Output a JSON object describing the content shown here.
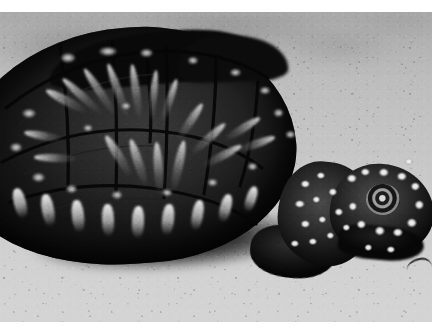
{
  "media": {
    "type": "photograph",
    "color_mode": "black-and-white",
    "orientation": "landscape",
    "width_px": 448,
    "height_px": 336,
    "has_visible_text": false,
    "print_border": {
      "color": "#ffffff",
      "top_px": 12,
      "right_px": 16,
      "bottom_px": 14,
      "left_px": 0
    }
  },
  "scene": {
    "subject": "box turtle",
    "subject_view": "three-quarter right, head extended toward lower right",
    "setting": "dry sandy ground",
    "lighting": "bright overhead sunlight, hard cast shadow beneath animal",
    "focus": "subject sharp, background blurred"
  },
  "subject": {
    "carapace_label": "carapace",
    "head_label": "head",
    "neck_label": "neck",
    "eye_label": "eye",
    "foreleg_label": "foreleg",
    "marginal_scutes_label": "marginal scutes",
    "pattern": "dark shell with radiating pale streaks in each scute; dark skin with scattered pale spots"
  },
  "background": {
    "ground_label": "sand",
    "shadow_label": "cast shadow",
    "rocks_label": "pale rocks",
    "debris_label": "twig"
  },
  "palette": {
    "border_white": "#ffffff",
    "sand_light": "#d4d4d4",
    "sand_mid": "#c2c2c2",
    "sand_dark": "#a9a9a9",
    "shell_dark": "#141414",
    "shell_black": "#0b0b0b",
    "skin_mid": "#303030",
    "highlight_white": "#f4f4f4",
    "shadow_black": "#080808"
  },
  "regions": {
    "rays": [
      {
        "left": 62,
        "top": 66,
        "w": 9,
        "h": 46,
        "rot": -62
      },
      {
        "left": 78,
        "top": 58,
        "w": 8,
        "h": 52,
        "rot": -48
      },
      {
        "left": 96,
        "top": 52,
        "w": 8,
        "h": 56,
        "rot": -34
      },
      {
        "left": 114,
        "top": 50,
        "w": 8,
        "h": 58,
        "rot": -20
      },
      {
        "left": 132,
        "top": 52,
        "w": 8,
        "h": 56,
        "rot": -8
      },
      {
        "left": 150,
        "top": 58,
        "w": 7,
        "h": 52,
        "rot": 6
      },
      {
        "left": 166,
        "top": 66,
        "w": 7,
        "h": 46,
        "rot": 18
      },
      {
        "left": 40,
        "top": 104,
        "w": 8,
        "h": 40,
        "rot": -80
      },
      {
        "left": 52,
        "top": 124,
        "w": 8,
        "h": 44,
        "rot": -88
      },
      {
        "left": 186,
        "top": 88,
        "w": 8,
        "h": 44,
        "rot": 34
      },
      {
        "left": 204,
        "top": 104,
        "w": 8,
        "h": 46,
        "rot": 48
      },
      {
        "left": 218,
        "top": 122,
        "w": 8,
        "h": 44,
        "rot": 62
      },
      {
        "left": 174,
        "top": 128,
        "w": 9,
        "h": 52,
        "rot": 12
      },
      {
        "left": 154,
        "top": 130,
        "w": 9,
        "h": 54,
        "rot": -4
      },
      {
        "left": 134,
        "top": 126,
        "w": 9,
        "h": 50,
        "rot": -18
      },
      {
        "left": 114,
        "top": 120,
        "w": 9,
        "h": 48,
        "rot": -32
      },
      {
        "left": 238,
        "top": 96,
        "w": 8,
        "h": 42,
        "rot": 58
      },
      {
        "left": 252,
        "top": 112,
        "w": 8,
        "h": 40,
        "rot": 70
      }
    ],
    "blotches": [
      {
        "left": 58,
        "top": 40,
        "w": 20,
        "h": 13
      },
      {
        "left": 96,
        "top": 34,
        "w": 24,
        "h": 12
      },
      {
        "left": 138,
        "top": 36,
        "w": 17,
        "h": 11
      },
      {
        "left": 186,
        "top": 44,
        "w": 14,
        "h": 10
      },
      {
        "left": 228,
        "top": 56,
        "w": 15,
        "h": 10
      },
      {
        "left": 258,
        "top": 74,
        "w": 14,
        "h": 10
      },
      {
        "left": 272,
        "top": 96,
        "w": 13,
        "h": 11
      },
      {
        "left": 284,
        "top": 118,
        "w": 13,
        "h": 10
      },
      {
        "left": 20,
        "top": 96,
        "w": 18,
        "h": 12
      },
      {
        "left": 8,
        "top": 130,
        "w": 16,
        "h": 12
      },
      {
        "left": 30,
        "top": 160,
        "w": 17,
        "h": 12
      },
      {
        "left": 64,
        "top": 172,
        "w": 15,
        "h": 11
      },
      {
        "left": 110,
        "top": 178,
        "w": 14,
        "h": 11
      },
      {
        "left": 160,
        "top": 176,
        "w": 14,
        "h": 10
      },
      {
        "left": 206,
        "top": 166,
        "w": 13,
        "h": 10
      },
      {
        "left": 246,
        "top": 150,
        "w": 13,
        "h": 10
      },
      {
        "left": 120,
        "top": 90,
        "w": 12,
        "h": 9
      },
      {
        "left": 82,
        "top": 112,
        "w": 12,
        "h": 9
      }
    ],
    "marginals": [
      {
        "left": 14,
        "top": 176,
        "w": 12,
        "h": 30,
        "rot": -14
      },
      {
        "left": 42,
        "top": 182,
        "w": 12,
        "h": 32,
        "rot": -10
      },
      {
        "left": 72,
        "top": 188,
        "w": 12,
        "h": 32,
        "rot": -6
      },
      {
        "left": 102,
        "top": 192,
        "w": 12,
        "h": 32,
        "rot": -2
      },
      {
        "left": 132,
        "top": 194,
        "w": 12,
        "h": 32,
        "rot": 2
      },
      {
        "left": 162,
        "top": 192,
        "w": 12,
        "h": 31,
        "rot": 6
      },
      {
        "left": 192,
        "top": 188,
        "w": 11,
        "h": 30,
        "rot": 10
      },
      {
        "left": 220,
        "top": 182,
        "w": 11,
        "h": 28,
        "rot": 14
      },
      {
        "left": 246,
        "top": 174,
        "w": 10,
        "h": 26,
        "rot": 18
      }
    ],
    "skin_spots": [
      {
        "left": 300,
        "top": 168,
        "w": 11,
        "h": 9
      },
      {
        "left": 316,
        "top": 160,
        "w": 10,
        "h": 8
      },
      {
        "left": 294,
        "top": 188,
        "w": 12,
        "h": 9
      },
      {
        "left": 312,
        "top": 184,
        "w": 9,
        "h": 8
      },
      {
        "left": 328,
        "top": 176,
        "w": 10,
        "h": 9
      },
      {
        "left": 300,
        "top": 208,
        "w": 11,
        "h": 9
      },
      {
        "left": 318,
        "top": 204,
        "w": 9,
        "h": 8
      },
      {
        "left": 334,
        "top": 196,
        "w": 10,
        "h": 9
      },
      {
        "left": 290,
        "top": 228,
        "w": 10,
        "h": 8
      },
      {
        "left": 308,
        "top": 226,
        "w": 10,
        "h": 8
      },
      {
        "left": 326,
        "top": 220,
        "w": 9,
        "h": 8
      },
      {
        "left": 342,
        "top": 212,
        "w": 9,
        "h": 8
      },
      {
        "left": 346,
        "top": 162,
        "w": 12,
        "h": 10
      },
      {
        "left": 360,
        "top": 156,
        "w": 11,
        "h": 9
      },
      {
        "left": 378,
        "top": 156,
        "w": 12,
        "h": 10
      },
      {
        "left": 396,
        "top": 160,
        "w": 12,
        "h": 10
      },
      {
        "left": 410,
        "top": 170,
        "w": 11,
        "h": 10
      },
      {
        "left": 414,
        "top": 188,
        "w": 11,
        "h": 11
      },
      {
        "left": 406,
        "top": 206,
        "w": 12,
        "h": 11
      },
      {
        "left": 392,
        "top": 216,
        "w": 12,
        "h": 10
      },
      {
        "left": 374,
        "top": 214,
        "w": 12,
        "h": 11
      },
      {
        "left": 356,
        "top": 208,
        "w": 11,
        "h": 10
      },
      {
        "left": 348,
        "top": 190,
        "w": 10,
        "h": 10
      },
      {
        "left": 404,
        "top": 146,
        "w": 10,
        "h": 8
      },
      {
        "left": 386,
        "top": 234,
        "w": 10,
        "h": 8
      },
      {
        "left": 364,
        "top": 232,
        "w": 9,
        "h": 8
      }
    ]
  }
}
